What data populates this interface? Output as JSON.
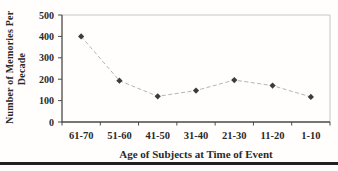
{
  "chart_data": {
    "type": "line",
    "title": "",
    "xlabel": "Age of Subjects at Time of Event",
    "ylabel": "Number of Memories Per Decade",
    "ylabel_lines": [
      "Number of Memories Per",
      "Decade"
    ],
    "categories": [
      "61-70",
      "51-60",
      "41-50",
      "31-40",
      "21-30",
      "11-20",
      "1-10"
    ],
    "series": [
      {
        "name": "Number of Memories Per Decade",
        "values": [
          400,
          193,
          120,
          147,
          196,
          170,
          117
        ],
        "marker": "diamond",
        "marker_color": "#3c3c3c",
        "line_color": "#b5b5b5",
        "line_style": "dashed"
      }
    ],
    "ylim": [
      0,
      500
    ],
    "yticks": [
      0,
      100,
      200,
      300,
      400,
      500
    ],
    "grid": false,
    "legend": false,
    "axis_color": "#4a4a4a",
    "frame_color": "#c6c6c6",
    "text_color": "#2a2a2a"
  },
  "figure": {
    "bottom_rule_color": "#212121"
  }
}
